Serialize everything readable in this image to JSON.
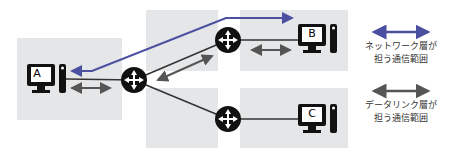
{
  "nodes": {
    "a": {
      "label": "A"
    },
    "b": {
      "label": "B"
    },
    "c": {
      "label": "C"
    }
  },
  "legend": {
    "network": {
      "line1": "ネットワーク層が",
      "line2": "担う通信範囲",
      "color": "#4a4fa0"
    },
    "datalink": {
      "line1": "データリンク層が",
      "line2": "担う通信範囲",
      "color": "#555555"
    }
  },
  "colors": {
    "segment_bg": "#e4e6e8",
    "router": "#111111",
    "network_arrow": "#4a4fa0",
    "datalink_arrow": "#555555"
  }
}
